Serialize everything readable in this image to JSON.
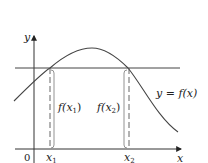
{
  "figure": {
    "axes": {
      "x_label": "x",
      "y_label": "y",
      "origin_label": "0"
    },
    "curve_label": "y = f(x)",
    "points": {
      "x1_label": "x",
      "x1_sub": "1",
      "x2_label": "x",
      "x2_sub": "2"
    },
    "heights": {
      "f1_prefix": "f(",
      "f1_var": "x",
      "f1_sub": "1",
      "f1_suffix": ")",
      "f2_prefix": "f(",
      "f2_var": "x",
      "f2_sub": "2",
      "f2_suffix": ")"
    },
    "colors": {
      "line": "#333333",
      "dashed": "#555555",
      "bracket": "#777777"
    }
  }
}
